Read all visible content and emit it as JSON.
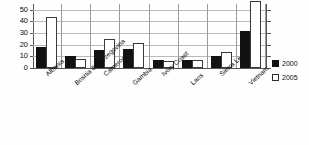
{
  "chart_data": {
    "type": "bar",
    "title": "",
    "xlabel": "",
    "ylabel": "",
    "ylim": [
      0,
      50
    ],
    "yticks": [
      0,
      10,
      20,
      30,
      40,
      50
    ],
    "grid": true,
    "legend_position": "right",
    "categories": [
      "Albania",
      "Bosnia & Herzegovina",
      "Cameroon",
      "Gambia",
      "Ivory Coast",
      "Laos",
      "Sierra Leone",
      "Vietnam"
    ],
    "series": [
      {
        "name": "2000",
        "color": "#121212",
        "values": [
          16,
          9,
          14,
          15,
          5,
          5,
          9,
          30
        ]
      },
      {
        "name": "2005",
        "color": "#ffffff",
        "values": [
          42,
          6,
          23,
          20,
          4,
          5,
          12,
          56
        ]
      }
    ]
  },
  "legend": {
    "items": [
      {
        "label": "2000"
      },
      {
        "label": "2005"
      }
    ]
  }
}
